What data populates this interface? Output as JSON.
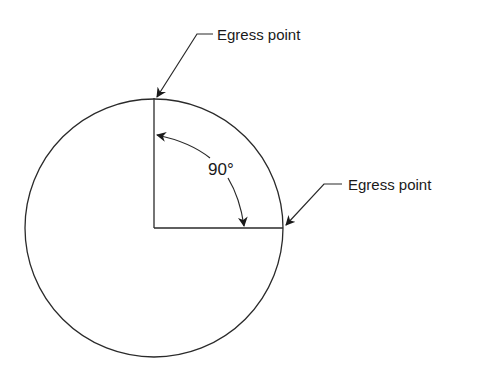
{
  "diagram": {
    "labels": {
      "top_egress": "Egress point",
      "right_egress": "Egress point",
      "angle": "90°"
    },
    "colors": {
      "stroke": "#2a2a2a",
      "background": "#ffffff"
    }
  }
}
